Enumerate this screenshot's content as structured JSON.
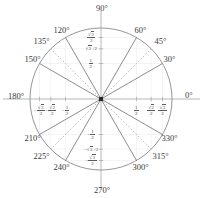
{
  "figure": {
    "center": {
      "x": 101,
      "y": 99
    },
    "radius": 71,
    "colors": {
      "circle": "#8a8a8a",
      "axis": "#9a9a9a",
      "solid_ray": "#707070",
      "dashed_ray": "#a8a8a8",
      "text": "#3a3a3a",
      "center_dot": "#2a2a2a",
      "background": "#ffffff"
    }
  },
  "axis_endpoint_labels": [
    {
      "name": "angle-0",
      "text": "0°",
      "degrees": 0
    },
    {
      "name": "angle-90",
      "text": "90°",
      "degrees": 90
    },
    {
      "name": "angle-180",
      "text": "180°",
      "degrees": 180
    },
    {
      "name": "angle-270",
      "text": "270°",
      "degrees": 270
    }
  ],
  "angle_labels": [
    {
      "name": "angle-30",
      "text": "30°",
      "degrees": 30
    },
    {
      "name": "angle-45",
      "text": "45°",
      "degrees": 45
    },
    {
      "name": "angle-60",
      "text": "60°",
      "degrees": 60
    },
    {
      "name": "angle-120",
      "text": "120°",
      "degrees": 120
    },
    {
      "name": "angle-135",
      "text": "135°",
      "degrees": 135
    },
    {
      "name": "angle-150",
      "text": "150°",
      "degrees": 150
    },
    {
      "name": "angle-210",
      "text": "210°",
      "degrees": 210
    },
    {
      "name": "angle-225",
      "text": "225°",
      "degrees": 225
    },
    {
      "name": "angle-240",
      "text": "240°",
      "degrees": 240
    },
    {
      "name": "angle-300",
      "text": "300°",
      "degrees": 300
    },
    {
      "name": "angle-315",
      "text": "315°",
      "degrees": 315
    },
    {
      "name": "angle-330",
      "text": "330°",
      "degrees": 330
    }
  ],
  "rays": [
    {
      "degrees": 30,
      "style": "solid"
    },
    {
      "degrees": 45,
      "style": "dashed"
    },
    {
      "degrees": 60,
      "style": "solid"
    },
    {
      "degrees": 120,
      "style": "solid"
    },
    {
      "degrees": 135,
      "style": "dashed"
    },
    {
      "degrees": 150,
      "style": "solid"
    },
    {
      "degrees": 210,
      "style": "solid"
    },
    {
      "degrees": 225,
      "style": "dashed"
    },
    {
      "degrees": 240,
      "style": "solid"
    },
    {
      "degrees": 300,
      "style": "solid"
    },
    {
      "degrees": 315,
      "style": "dashed"
    },
    {
      "degrees": 330,
      "style": "solid"
    }
  ],
  "x_axis_ticks": [
    {
      "name": "tick-neg-sqrt3-2",
      "value": -0.866,
      "numerator": "√3",
      "denominator": "2",
      "sign": "−",
      "display": "-√3/2"
    },
    {
      "name": "tick-neg-sqrt2-2",
      "value": -0.707,
      "numerator": "√2",
      "denominator": "2",
      "sign": "−",
      "display": "-√2/2"
    },
    {
      "name": "tick-neg-one-half",
      "value": -0.5,
      "numerator": "1",
      "denominator": "2",
      "sign": "−",
      "display": "-1/2"
    },
    {
      "name": "tick-pos-one-half",
      "value": 0.5,
      "numerator": "1",
      "denominator": "2",
      "sign": "",
      "display": "1/2"
    },
    {
      "name": "tick-pos-sqrt2-2",
      "value": 0.707,
      "numerator": "√2",
      "denominator": "2",
      "sign": "",
      "display": "√2/2"
    },
    {
      "name": "tick-pos-sqrt3-2",
      "value": 0.866,
      "numerator": "√3",
      "denominator": "2",
      "sign": "",
      "display": "√3/2"
    }
  ],
  "y_axis_ticks": [
    {
      "name": "tick-y-sqrt3-2",
      "value": 0.866,
      "numerator": "√3",
      "denominator": "2",
      "inline": false,
      "display": "√3/2"
    },
    {
      "name": "tick-y-sqrt2-2",
      "value": 0.707,
      "numerator": "√2",
      "denominator": "2",
      "inline": true,
      "display": "√2/2"
    },
    {
      "name": "tick-y-one-half",
      "value": 0.5,
      "numerator": "1",
      "denominator": "2",
      "inline": false,
      "display": "1/2"
    },
    {
      "name": "tick-y-neg-one-half",
      "value": -0.5,
      "numerator": "1",
      "denominator": "2",
      "inline": false,
      "display": "-1/2"
    },
    {
      "name": "tick-y-neg-sqrt2-2",
      "value": -0.707,
      "numerator": "√2",
      "denominator": "2",
      "inline": true,
      "display": "-√2/2"
    },
    {
      "name": "tick-y-neg-sqrt3-2",
      "value": -0.866,
      "numerator": "√3",
      "denominator": "2",
      "inline": false,
      "display": "-√3/2"
    }
  ],
  "chart_data": {
    "type": "scatter",
    "xlabel": "",
    "ylabel": "",
    "xlim": [
      -1,
      1
    ],
    "ylim": [
      -1,
      1
    ],
    "grid": true,
    "legend": "none",
    "categories": [
      "0°",
      "30°",
      "45°",
      "60°",
      "90°",
      "120°",
      "135°",
      "150°",
      "180°",
      "210°",
      "225°",
      "240°",
      "270°",
      "300°",
      "315°",
      "330°"
    ],
    "series": [
      {
        "name": "cos",
        "values": [
          1,
          0.866,
          0.707,
          0.5,
          0,
          -0.5,
          -0.707,
          -0.866,
          -1,
          -0.866,
          -0.707,
          -0.5,
          0,
          0.5,
          0.707,
          0.866
        ]
      },
      {
        "name": "sin",
        "values": [
          0,
          0.5,
          0.707,
          0.866,
          1,
          0.866,
          0.707,
          0.5,
          0,
          -0.5,
          -0.707,
          -0.866,
          -1,
          -0.866,
          -0.707,
          -0.5
        ]
      }
    ],
    "x_tick_labels": [
      "-√3/2",
      "-√2/2",
      "-1/2",
      "1/2",
      "√2/2",
      "√3/2"
    ],
    "y_tick_labels": [
      "√3/2",
      "√2/2",
      "1/2",
      "-1/2",
      "-√2/2",
      "-√3/2"
    ],
    "annotations": [
      "0°",
      "30°",
      "45°",
      "60°",
      "90°",
      "120°",
      "135°",
      "150°",
      "180°",
      "210°",
      "225°",
      "240°",
      "270°",
      "300°",
      "315°",
      "330°"
    ]
  }
}
